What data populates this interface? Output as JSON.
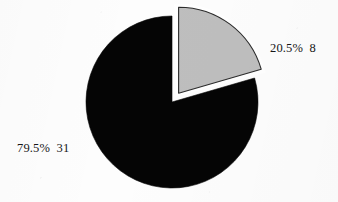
{
  "chart": {
    "background_color": "#fdfdfd",
    "center_x": 172,
    "center_y": 102,
    "radius": 86,
    "explode_distance": 11,
    "outline_color": "#2b2b2b",
    "gap_color": "#ffffff"
  },
  "chart_data": {
    "type": "pie",
    "title": "",
    "subtitle": "",
    "xlabel": "",
    "ylabel": "",
    "grid": false,
    "legend": "none",
    "start_angle_deg": 0,
    "direction": "clockwise",
    "total": 39,
    "categories": [
      "20.5% 8",
      "79.5% 31"
    ],
    "values": [
      8,
      31
    ],
    "percentages": [
      20.5,
      79.5
    ],
    "colors": [
      "#bebebe",
      "#050505"
    ],
    "annotations": [
      "20.5%  8",
      "79.5%  31"
    ],
    "series": [
      {
        "name": "slices",
        "values": [
          8,
          31
        ]
      }
    ],
    "slices": [
      {
        "label": "20.5%  8",
        "percent_text": "20.5%",
        "count_text": "8",
        "value": 8,
        "percent": 20.5,
        "color": "#bebebe",
        "exploded": true,
        "start_angle_deg": 0,
        "end_angle_deg": 73.8
      },
      {
        "label": "79.5%  31",
        "percent_text": "79.5%",
        "count_text": "31",
        "value": 31,
        "percent": 79.5,
        "color": "#050505",
        "exploded": false,
        "start_angle_deg": 73.8,
        "end_angle_deg": 360
      }
    ]
  }
}
